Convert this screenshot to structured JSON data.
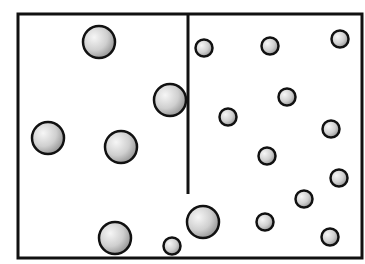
{
  "diagram": {
    "container": {
      "x": 18,
      "y": 14,
      "w": 344,
      "h": 244
    },
    "partition": {
      "x": 188,
      "y1": 14,
      "y2": 194
    },
    "large_particles": [
      {
        "cx": 99,
        "cy": 42,
        "r": 16
      },
      {
        "cx": 170,
        "cy": 100,
        "r": 16
      },
      {
        "cx": 48,
        "cy": 138,
        "r": 16
      },
      {
        "cx": 121,
        "cy": 147,
        "r": 16
      },
      {
        "cx": 203,
        "cy": 222,
        "r": 16
      },
      {
        "cx": 115,
        "cy": 238,
        "r": 16
      }
    ],
    "small_particles": [
      {
        "cx": 204,
        "cy": 48,
        "r": 8.5
      },
      {
        "cx": 270,
        "cy": 46,
        "r": 8.5
      },
      {
        "cx": 340,
        "cy": 39,
        "r": 8.5
      },
      {
        "cx": 287,
        "cy": 97,
        "r": 8.5
      },
      {
        "cx": 228,
        "cy": 117,
        "r": 8.5
      },
      {
        "cx": 331,
        "cy": 129,
        "r": 8.5
      },
      {
        "cx": 267,
        "cy": 156,
        "r": 8.5
      },
      {
        "cx": 339,
        "cy": 178,
        "r": 8.5
      },
      {
        "cx": 304,
        "cy": 199,
        "r": 8.5
      },
      {
        "cx": 265,
        "cy": 222,
        "r": 8.5
      },
      {
        "cx": 330,
        "cy": 237,
        "r": 8.5
      },
      {
        "cx": 172,
        "cy": 246,
        "r": 8.5
      }
    ],
    "colors": {
      "stroke": "#111111",
      "fill_light": "#f4f4f4",
      "fill_dark": "#8e8e8e"
    }
  }
}
